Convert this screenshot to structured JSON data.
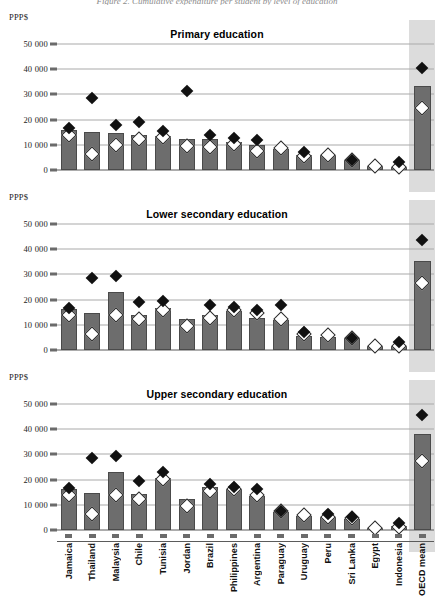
{
  "figure": {
    "cropped_header": "Figure 2.  Cumulative expenditure per student by level of education",
    "yaxis_unit_label": "PPP$",
    "y_ticks": [
      "0",
      "10 000",
      "20 000",
      "30 000",
      "40 000",
      "50 000"
    ],
    "y_tick_values": [
      0,
      10000,
      20000,
      30000,
      40000,
      50000
    ],
    "ylim": [
      0,
      52000
    ],
    "highlight_category": "OECD mean",
    "colors": {
      "bar": "#6d6d6d",
      "bar_border": "#4a4a4a",
      "black_marker": "#111111",
      "white_marker": "#ffffff",
      "gridline": "#a9a9a9",
      "highlight_band": "#dcdcdc"
    }
  },
  "categories": [
    "Jamaica",
    "Thailand",
    "Malaysia",
    "Chile",
    "Tunisia",
    "Jordan",
    "Brazil",
    "Philippines",
    "Argentina",
    "Paraguay",
    "Uruguay",
    "Peru",
    "Sri Lanka",
    "Egypt",
    "Indonesia",
    "OECD mean"
  ],
  "chart_data": [
    {
      "type": "bar",
      "title": "Primary education",
      "xlabel": "",
      "ylabel": "PPP$",
      "ylim": [
        0,
        52000
      ],
      "grid": true,
      "legend": "none",
      "categories": [
        "Jamaica",
        "Thailand",
        "Malaysia",
        "Chile",
        "Tunisia",
        "Jordan",
        "Brazil",
        "Philippines",
        "Argentina",
        "Paraguay",
        "Uruguay",
        "Peru",
        "Sri Lanka",
        "Egypt",
        "Indonesia",
        "OECD mean"
      ],
      "series": [
        {
          "name": "bar",
          "marker": "bar",
          "values": [
            15800,
            15100,
            14700,
            14000,
            13400,
            12500,
            12200,
            11200,
            10000,
            8200,
            5900,
            5900,
            4000,
            1500,
            1200,
            33500
          ]
        },
        {
          "name": "black-diamond",
          "marker": "black-diamond",
          "values": [
            16800,
            28700,
            18000,
            19000,
            15400,
            31200,
            13700,
            12600,
            11800,
            null,
            7300,
            null,
            4100,
            null,
            3000,
            40500
          ]
        },
        {
          "name": "white-diamond",
          "marker": "white-diamond",
          "values": [
            13700,
            6500,
            9900,
            12200,
            13200,
            9400,
            9300,
            10400,
            7400,
            8700,
            5700,
            6000,
            3900,
            1400,
            1100,
            24500
          ]
        }
      ]
    },
    {
      "type": "bar",
      "title": "Lower secondary education",
      "xlabel": "",
      "ylabel": "PPP$",
      "ylim": [
        0,
        52000
      ],
      "grid": true,
      "legend": "none",
      "categories": [
        "Jamaica",
        "Thailand",
        "Malaysia",
        "Chile",
        "Tunisia",
        "Jordan",
        "Brazil",
        "Philippines",
        "Argentina",
        "Paraguay",
        "Uruguay",
        "Peru",
        "Sri Lanka",
        "Egypt",
        "Indonesia",
        "OECD mean"
      ],
      "series": [
        {
          "name": "bar",
          "marker": "bar",
          "values": [
            16100,
            14800,
            22900,
            13700,
            16600,
            12300,
            13700,
            15400,
            12700,
            12100,
            5700,
            5200,
            4700,
            1700,
            1500,
            35500
          ]
        },
        {
          "name": "black-diamond",
          "marker": "black-diamond",
          "values": [
            16800,
            28700,
            29500,
            18900,
            19600,
            null,
            17700,
            17200,
            16000,
            18000,
            7100,
            null,
            4800,
            null,
            3000,
            43500
          ]
        },
        {
          "name": "white-diamond",
          "marker": "white-diamond",
          "values": [
            13700,
            6500,
            13800,
            12200,
            16000,
            9400,
            12800,
            15900,
            14500,
            12200,
            6300,
            5900,
            4600,
            1600,
            1400,
            26500
          ]
        }
      ]
    },
    {
      "type": "bar",
      "title": "Upper secondary education",
      "xlabel": "",
      "ylabel": "PPP$",
      "ylim": [
        0,
        52000
      ],
      "grid": true,
      "legend": "none",
      "categories": [
        "Jamaica",
        "Thailand",
        "Malaysia",
        "Chile",
        "Tunisia",
        "Jordan",
        "Brazil",
        "Philippines",
        "Argentina",
        "Paraguay",
        "Uruguay",
        "Peru",
        "Sri Lanka",
        "Egypt",
        "Indonesia",
        "OECD mean"
      ],
      "series": [
        {
          "name": "bar",
          "marker": "bar",
          "values": [
            16200,
            14800,
            22900,
            14300,
            20600,
            12300,
            17200,
            16100,
            13400,
            7000,
            5500,
            5100,
            4500,
            700,
            1600,
            38000
          ]
        },
        {
          "name": "black-diamond",
          "marker": "black-diamond",
          "values": [
            16800,
            28700,
            29300,
            19600,
            23100,
            null,
            18200,
            17000,
            16400,
            7400,
            null,
            6200,
            5300,
            null,
            2900,
            45500
          ]
        },
        {
          "name": "white-diamond",
          "marker": "white-diamond",
          "values": [
            13700,
            6500,
            13800,
            12200,
            20400,
            9400,
            15600,
            16400,
            13700,
            7600,
            6000,
            5000,
            4700,
            600,
            1300,
            27500
          ]
        }
      ]
    }
  ]
}
